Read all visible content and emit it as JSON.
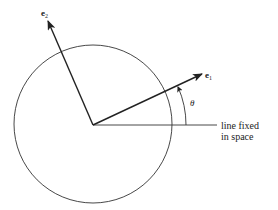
{
  "diagram": {
    "labels": {
      "e1": {
        "base": "e",
        "sub": "1"
      },
      "e2": {
        "base": "e",
        "sub": "2"
      },
      "theta": "θ",
      "fixed_line_line1": "line fixed",
      "fixed_line_line2": "in space"
    },
    "elements": [
      "circle",
      "vector-e1",
      "vector-e2",
      "fixed-reference-line",
      "angle-arc-theta"
    ],
    "colors": {
      "stroke": "#222222",
      "background": "#ffffff"
    }
  }
}
